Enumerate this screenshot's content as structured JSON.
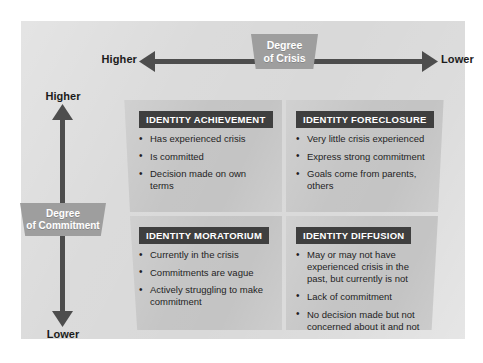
{
  "figure": {
    "background_color": "#d9d9d9",
    "quadrant_color": "#c4c4c4",
    "title_bar_color": "#3f3f3f",
    "tag_color": "#9e9e9e",
    "axis_color": "#4d4d4d"
  },
  "horizontal_axis": {
    "tag_line1": "Degree",
    "tag_line2": "of Crisis",
    "left_label": "Higher",
    "right_label": "Lower"
  },
  "vertical_axis": {
    "tag_line1": "Degree",
    "tag_line2": "of Commitment",
    "top_label": "Higher",
    "bottom_label": "Lower"
  },
  "quadrants": [
    {
      "id": "identity-achievement",
      "title": "IDENTITY ACHIEVEMENT",
      "bullets": [
        "Has experienced crisis",
        "Is committed",
        "Decision made on own terms"
      ]
    },
    {
      "id": "identity-foreclosure",
      "title": "IDENTITY FORECLOSURE",
      "bullets": [
        "Very little crisis experienced",
        "Express strong commitment",
        "Goals come from parents, others"
      ]
    },
    {
      "id": "identity-moratorium",
      "title": "IDENTITY MORATORIUM",
      "bullets": [
        "Currently in the crisis",
        "Commitments are vague",
        "Actively struggling to make commitment"
      ]
    },
    {
      "id": "identity-diffusion",
      "title": "IDENTITY DIFFUSION",
      "bullets": [
        "May or may not have experienced crisis in the past, but currently is not",
        "Lack of commitment",
        "No decision made but not concerned about it and not actively working on it"
      ]
    }
  ]
}
